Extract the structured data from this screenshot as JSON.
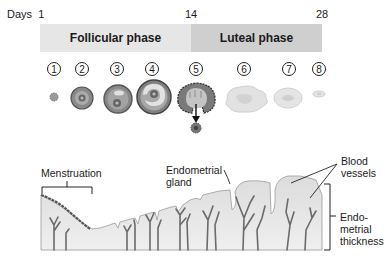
{
  "days": {
    "prefix": "Days",
    "start": "1",
    "mid": "14",
    "end": "28"
  },
  "phases": [
    {
      "label": "Follicular phase",
      "color": "#e6e6e6"
    },
    {
      "label": "Luteal phase",
      "color": "#cfcfcf"
    }
  ],
  "stages": [
    "1",
    "2",
    "3",
    "4",
    "5",
    "6",
    "7",
    "8"
  ],
  "labels": {
    "menstruation": "Menstruation",
    "gland_line1": "Endometrial",
    "gland_line2": "gland",
    "vessels_line1": "Blood",
    "vessels_line2": "vessels",
    "thickness_line1": "Endo-",
    "thickness_line2": "metrial",
    "thickness_line3": "thickness"
  }
}
